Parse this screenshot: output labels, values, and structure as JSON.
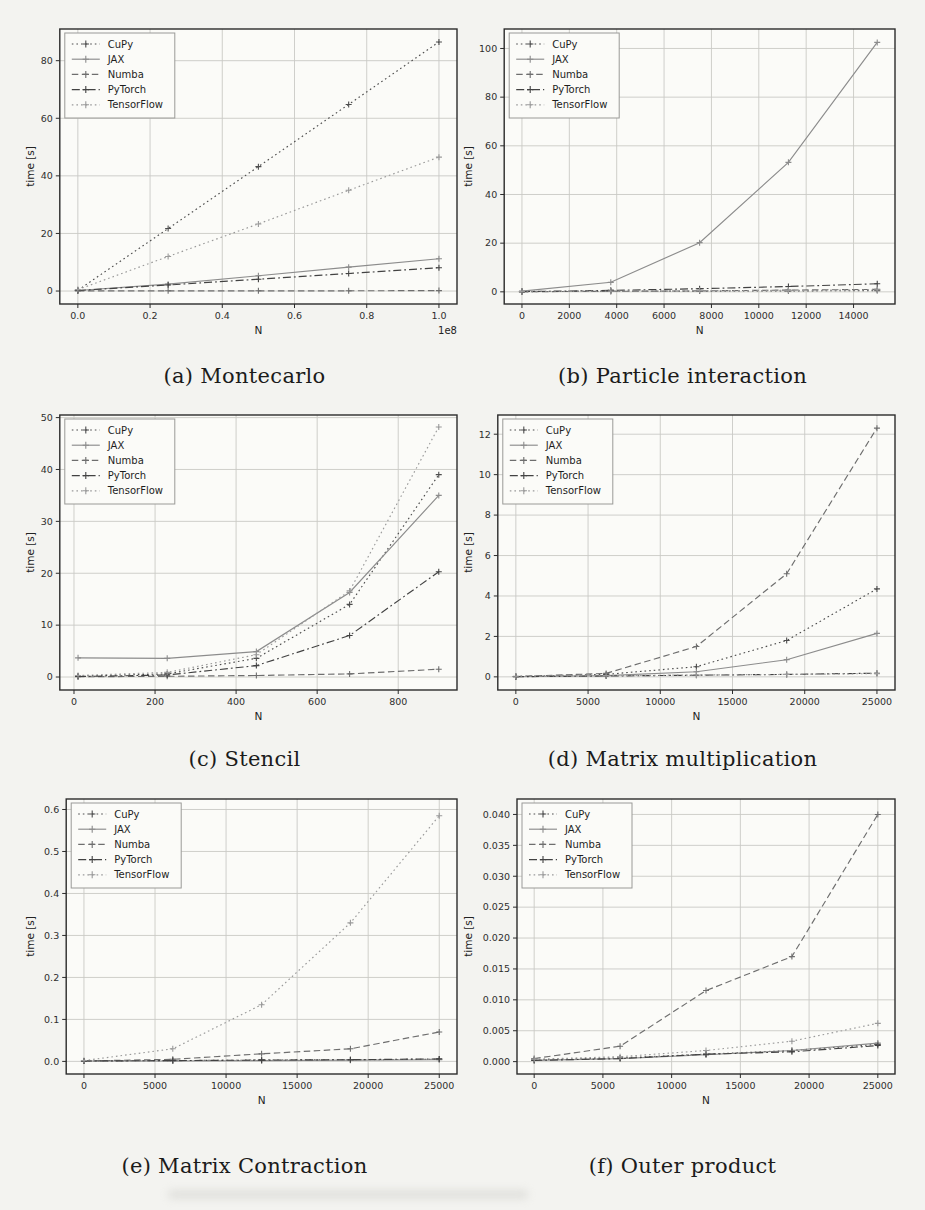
{
  "figure": {
    "ylabel_shared": "time [s]",
    "xlabel_shared": "N",
    "legend_entries": [
      "CuPy",
      "JAX",
      "Numba",
      "PyTorch",
      "TensorFlow"
    ],
    "series_colors": {
      "CuPy": "#4d4d4d",
      "JAX": "#8c8c8c",
      "Numba": "#6e6e6e",
      "PyTorch": "#424242",
      "TensorFlow": "#9a9a9a"
    },
    "ink_color": "#2b2b2b",
    "grid_color": "#c9c9c5",
    "plot_bg": "#fbfbf8",
    "page_bg": "#f3f3f0"
  },
  "chart_data": [
    {
      "id": "a",
      "type": "line",
      "caption": "(a) Montecarlo",
      "xlabel": "N",
      "ylabel": "time [s]",
      "x_offset_label": "1e8",
      "x": [
        0,
        0.25,
        0.5,
        0.75,
        1.0
      ],
      "xlim": [
        -0.05,
        1.05
      ],
      "ylim": [
        -4.5,
        91
      ],
      "xticks": [
        0.0,
        0.2,
        0.4,
        0.6,
        0.8,
        1.0
      ],
      "xtick_labels": [
        "0.0",
        "0.2",
        "0.4",
        "0.6",
        "0.8",
        "1.0"
      ],
      "yticks": [
        0,
        20,
        40,
        60,
        80
      ],
      "ytick_labels": [
        "0",
        "20",
        "40",
        "60",
        "80"
      ],
      "grid": true,
      "legend_position": "upper left",
      "series": [
        {
          "name": "CuPy",
          "style": "dotted",
          "values": [
            0.3,
            21.7,
            43.2,
            64.8,
            86.5
          ]
        },
        {
          "name": "JAX",
          "style": "solid",
          "values": [
            0.2,
            2.4,
            5.3,
            8.3,
            11.2
          ]
        },
        {
          "name": "Numba",
          "style": "dashed",
          "values": [
            0.05,
            0.1,
            0.1,
            0.1,
            0.15
          ]
        },
        {
          "name": "PyTorch",
          "style": "dashdot",
          "values": [
            0.2,
            2.1,
            4.1,
            6.1,
            8.1
          ]
        },
        {
          "name": "TensorFlow",
          "style": "dotted",
          "values": [
            0.5,
            12.0,
            23.3,
            35.0,
            46.5
          ]
        }
      ]
    },
    {
      "id": "b",
      "type": "line",
      "caption": "(b) Particle interaction",
      "xlabel": "N",
      "ylabel": "time [s]",
      "x_offset_label": "",
      "x": [
        0,
        3750,
        7500,
        11250,
        15000
      ],
      "xlim": [
        -750,
        15750
      ],
      "ylim": [
        -5,
        108
      ],
      "xticks": [
        0,
        2000,
        4000,
        6000,
        8000,
        10000,
        12000,
        14000
      ],
      "xtick_labels": [
        "0",
        "2000",
        "4000",
        "6000",
        "8000",
        "10000",
        "12000",
        "14000"
      ],
      "yticks": [
        0,
        20,
        40,
        60,
        80,
        100
      ],
      "ytick_labels": [
        "0",
        "20",
        "40",
        "60",
        "80",
        "100"
      ],
      "grid": true,
      "legend_position": "upper left",
      "series": [
        {
          "name": "CuPy",
          "style": "dotted",
          "values": [
            0.1,
            0.2,
            0.3,
            0.4,
            0.5
          ]
        },
        {
          "name": "JAX",
          "style": "solid",
          "values": [
            0.3,
            3.9,
            20.2,
            53.2,
            102.5
          ]
        },
        {
          "name": "Numba",
          "style": "dashed",
          "values": [
            0.05,
            0.2,
            0.4,
            0.7,
            1.0
          ]
        },
        {
          "name": "PyTorch",
          "style": "dashdot",
          "values": [
            0.1,
            0.6,
            1.3,
            2.2,
            3.3
          ]
        },
        {
          "name": "TensorFlow",
          "style": "dotted",
          "values": [
            0.2,
            0.3,
            0.5,
            0.6,
            0.8
          ]
        }
      ]
    },
    {
      "id": "c",
      "type": "line",
      "caption": "(c) Stencil",
      "xlabel": "N",
      "ylabel": "time [s]",
      "x_offset_label": "",
      "x": [
        10,
        230,
        450,
        680,
        900
      ],
      "xlim": [
        -35,
        945
      ],
      "ylim": [
        -2.5,
        50.5
      ],
      "xticks": [
        0,
        200,
        400,
        600,
        800
      ],
      "xtick_labels": [
        "0",
        "200",
        "400",
        "600",
        "800"
      ],
      "yticks": [
        0,
        10,
        20,
        30,
        40,
        50
      ],
      "ytick_labels": [
        "0",
        "10",
        "20",
        "30",
        "40",
        "50"
      ],
      "grid": true,
      "legend_position": "upper left",
      "series": [
        {
          "name": "CuPy",
          "style": "dotted",
          "values": [
            0.2,
            0.6,
            3.6,
            14.0,
            39.0
          ]
        },
        {
          "name": "JAX",
          "style": "solid",
          "values": [
            3.7,
            3.6,
            4.9,
            16.3,
            35.0
          ]
        },
        {
          "name": "Numba",
          "style": "dashed",
          "values": [
            0.05,
            0.15,
            0.3,
            0.6,
            1.5
          ]
        },
        {
          "name": "PyTorch",
          "style": "dashdot",
          "values": [
            0.1,
            0.4,
            2.2,
            8.0,
            20.3
          ]
        },
        {
          "name": "TensorFlow",
          "style": "dotted",
          "values": [
            0.3,
            0.9,
            4.3,
            16.6,
            48.2
          ]
        }
      ]
    },
    {
      "id": "d",
      "type": "line",
      "caption": "(d) Matrix multiplication",
      "xlabel": "N",
      "ylabel": "time [s]",
      "x_offset_label": "",
      "x": [
        0,
        6250,
        12500,
        18750,
        25000
      ],
      "xlim": [
        -1250,
        26250
      ],
      "ylim": [
        -0.65,
        12.95
      ],
      "xticks": [
        0,
        5000,
        10000,
        15000,
        20000,
        25000
      ],
      "xtick_labels": [
        "0",
        "5000",
        "10000",
        "15000",
        "20000",
        "25000"
      ],
      "yticks": [
        0,
        2,
        4,
        6,
        8,
        10,
        12
      ],
      "ytick_labels": [
        "0",
        "2",
        "4",
        "6",
        "8",
        "10",
        "12"
      ],
      "grid": true,
      "legend_position": "upper left",
      "series": [
        {
          "name": "CuPy",
          "style": "dotted",
          "values": [
            0.02,
            0.12,
            0.5,
            1.8,
            4.35
          ]
        },
        {
          "name": "JAX",
          "style": "solid",
          "values": [
            0.01,
            0.06,
            0.25,
            0.85,
            2.15
          ]
        },
        {
          "name": "Numba",
          "style": "dashed",
          "values": [
            0.02,
            0.17,
            1.5,
            5.1,
            12.3
          ]
        },
        {
          "name": "PyTorch",
          "style": "dashdot",
          "values": [
            0.01,
            0.04,
            0.08,
            0.12,
            0.18
          ]
        },
        {
          "name": "TensorFlow",
          "style": "dotted",
          "values": [
            0.03,
            0.06,
            0.09,
            0.12,
            0.16
          ]
        }
      ]
    },
    {
      "id": "e",
      "type": "line",
      "caption": "(e) Matrix Contraction",
      "xlabel": "N",
      "ylabel": "time [s]",
      "x_offset_label": "",
      "x": [
        0,
        6250,
        12500,
        18750,
        25000
      ],
      "xlim": [
        -1250,
        26250
      ],
      "ylim": [
        -0.03,
        0.625
      ],
      "xticks": [
        0,
        5000,
        10000,
        15000,
        20000,
        25000
      ],
      "xtick_labels": [
        "0",
        "5000",
        "10000",
        "15000",
        "20000",
        "25000"
      ],
      "yticks": [
        0.0,
        0.1,
        0.2,
        0.3,
        0.4,
        0.5,
        0.6
      ],
      "ytick_labels": [
        "0.0",
        "0.1",
        "0.2",
        "0.3",
        "0.4",
        "0.5",
        "0.6"
      ],
      "grid": true,
      "legend_position": "upper left",
      "series": [
        {
          "name": "CuPy",
          "style": "dotted",
          "values": [
            0.001,
            0.002,
            0.003,
            0.004,
            0.005
          ]
        },
        {
          "name": "JAX",
          "style": "solid",
          "values": [
            0.001,
            0.001,
            0.002,
            0.003,
            0.004
          ]
        },
        {
          "name": "Numba",
          "style": "dashed",
          "values": [
            0.001,
            0.005,
            0.018,
            0.03,
            0.07
          ]
        },
        {
          "name": "PyTorch",
          "style": "dashdot",
          "values": [
            0.001,
            0.002,
            0.003,
            0.004,
            0.006
          ]
        },
        {
          "name": "TensorFlow",
          "style": "dotted",
          "values": [
            0.002,
            0.03,
            0.135,
            0.33,
            0.585
          ]
        }
      ]
    },
    {
      "id": "f",
      "type": "line",
      "caption": "(f) Outer product",
      "xlabel": "N",
      "ylabel": "time [s]",
      "x_offset_label": "",
      "x": [
        0,
        6250,
        12500,
        18750,
        25000
      ],
      "xlim": [
        -1250,
        26250
      ],
      "ylim": [
        -0.002,
        0.0425
      ],
      "xticks": [
        0,
        5000,
        10000,
        15000,
        20000,
        25000
      ],
      "xtick_labels": [
        "0",
        "5000",
        "10000",
        "15000",
        "20000",
        "25000"
      ],
      "yticks": [
        0.0,
        0.005,
        0.01,
        0.015,
        0.02,
        0.025,
        0.03,
        0.035,
        0.04
      ],
      "ytick_labels": [
        "0.000",
        "0.005",
        "0.010",
        "0.015",
        "0.020",
        "0.025",
        "0.030",
        "0.035",
        "0.040"
      ],
      "grid": true,
      "legend_position": "upper left",
      "series": [
        {
          "name": "CuPy",
          "style": "dotted",
          "values": [
            0.0003,
            0.0006,
            0.0012,
            0.0018,
            0.0028
          ]
        },
        {
          "name": "JAX",
          "style": "solid",
          "values": [
            0.0002,
            0.0005,
            0.0011,
            0.0018,
            0.003
          ]
        },
        {
          "name": "Numba",
          "style": "dashed",
          "values": [
            0.0005,
            0.0025,
            0.0115,
            0.017,
            0.04
          ]
        },
        {
          "name": "PyTorch",
          "style": "dashdot",
          "values": [
            0.0002,
            0.0005,
            0.0012,
            0.0016,
            0.0026
          ]
        },
        {
          "name": "TensorFlow",
          "style": "dotted",
          "values": [
            0.0004,
            0.0008,
            0.0018,
            0.0033,
            0.0062
          ]
        }
      ]
    }
  ]
}
